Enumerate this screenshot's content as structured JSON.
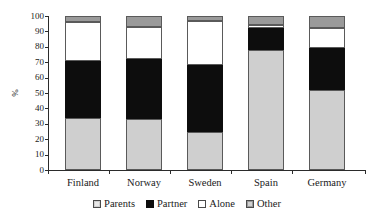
{
  "chart_data": {
    "type": "bar",
    "subtype": "stacked-bar-100",
    "title": "",
    "xlabel": "",
    "ylabel": "%",
    "ylim": [
      0,
      100
    ],
    "yticks": [
      0,
      10,
      20,
      30,
      40,
      50,
      60,
      70,
      80,
      90,
      100
    ],
    "ytick_labels": [
      "0",
      "10",
      "20",
      "30",
      "40",
      "50",
      "60",
      "70",
      "80",
      "90",
      "100"
    ],
    "grid": false,
    "legend_position": "bottom",
    "categories": [
      "Finland",
      "Norway",
      "Sweden",
      "Spain",
      "Germany"
    ],
    "series": [
      {
        "name": "Parents",
        "color": "#cfcfcf",
        "values": [
          34,
          33,
          25,
          78,
          52
        ]
      },
      {
        "name": "Partner",
        "color": "#0d0d0d",
        "values": [
          37,
          39,
          43,
          14,
          27
        ]
      },
      {
        "name": "Alone",
        "color": "#ffffff",
        "values": [
          25,
          21,
          29,
          2,
          13
        ]
      },
      {
        "name": "Other",
        "color": "#9a9a9a",
        "values": [
          4,
          7,
          3,
          6,
          8
        ]
      }
    ],
    "cumulative_tops": {
      "Finland": {
        "Parents": 34,
        "Partner": 71,
        "Alone": 96,
        "Other": 100
      },
      "Norway": {
        "Parents": 33,
        "Partner": 72,
        "Alone": 93,
        "Other": 100
      },
      "Sweden": {
        "Parents": 25,
        "Partner": 68,
        "Alone": 97,
        "Other": 100
      },
      "Spain": {
        "Parents": 78,
        "Partner": 92,
        "Alone": 94,
        "Other": 100
      },
      "Germany": {
        "Parents": 52,
        "Partner": 79,
        "Alone": 92,
        "Other": 100
      }
    }
  },
  "axis": {
    "y_title": "%",
    "y_ticks": [
      "100",
      "90",
      "80",
      "70",
      "60",
      "50",
      "40",
      "30",
      "20",
      "10",
      "0"
    ],
    "x_labels": [
      "Finland",
      "Norway",
      "Sweden",
      "Spain",
      "Germany"
    ]
  },
  "legend": {
    "items": [
      {
        "label": "Parents",
        "swatch": "light-grey-swatch"
      },
      {
        "label": "Partner",
        "swatch": "black-swatch"
      },
      {
        "label": "Alone",
        "swatch": "white-swatch"
      },
      {
        "label": "Other",
        "swatch": "dark-grey-swatch"
      }
    ]
  },
  "colors": {
    "parents": "#cfcfcf",
    "partner": "#0d0d0d",
    "alone": "#ffffff",
    "other": "#9a9a9a",
    "axis": "#2b2b2b",
    "text": "#1a1a1a",
    "background": "#ffffff"
  }
}
